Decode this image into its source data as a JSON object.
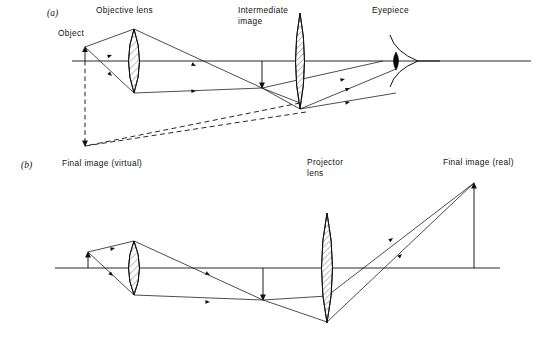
{
  "figure": {
    "background_color": "#ffffff",
    "ink_color": "#111111",
    "width": 545,
    "height": 338
  },
  "panels": [
    {
      "id": "a",
      "label": "(a)",
      "label_x": 47,
      "label_y": 16,
      "description": "Compound microscope forming a virtual final image",
      "axis": {
        "x1": 72,
        "x2": 531,
        "y": 61
      },
      "labels": [
        {
          "name": "object-label",
          "text": "Object",
          "x": 58,
          "y": 36,
          "anchor": "start"
        },
        {
          "name": "objective-lens-label",
          "text": "Objective lens",
          "x": 96,
          "y": 13,
          "anchor": "start"
        },
        {
          "name": "intermediate-image-label-line1",
          "text": "Intermediate",
          "x": 238,
          "y": 13,
          "anchor": "start"
        },
        {
          "name": "intermediate-image-label-line2",
          "text": "image",
          "x": 238,
          "y": 24,
          "anchor": "start"
        },
        {
          "name": "eyepiece-label",
          "text": "Eyepiece",
          "x": 372,
          "y": 13,
          "anchor": "start"
        },
        {
          "name": "final-image-virtual-label",
          "text": "Final image (virtual)",
          "x": 62,
          "y": 166,
          "anchor": "start"
        }
      ],
      "elements": {
        "object_arrow": {
          "x": 85,
          "y_base": 61,
          "y_tip": 47,
          "direction": "up",
          "style": "solid"
        },
        "intermediate_image_arrow": {
          "x": 262,
          "y_base": 61,
          "y_tip": 88,
          "direction": "down",
          "style": "solid"
        },
        "final_image_arrow": {
          "x": 85,
          "y_base": 61,
          "y_tip": 146,
          "direction": "down",
          "style": "dashed"
        },
        "objective_lens": {
          "cx": 134,
          "cy": 61,
          "half_width": 11,
          "half_height": 32
        },
        "eyepiece_lens": {
          "cx": 300,
          "cy": 61,
          "half_width": 9,
          "half_height": 48
        },
        "eye": {
          "cx": 396,
          "cy": 61
        }
      }
    },
    {
      "id": "b",
      "label": "(b)",
      "label_x": 21,
      "label_y": 165,
      "description": "Projector forming a real final image",
      "axis": {
        "x1": 55,
        "x2": 500,
        "y": 268
      },
      "labels": [
        {
          "name": "projector-lens-label-line1",
          "text": "Projector",
          "x": 307,
          "y": 165,
          "anchor": "start"
        },
        {
          "name": "projector-lens-label-line2",
          "text": "lens",
          "x": 307,
          "y": 176,
          "anchor": "start"
        },
        {
          "name": "final-image-real-label",
          "text": "Final image (real)",
          "x": 443,
          "y": 165,
          "anchor": "start"
        }
      ],
      "elements": {
        "object_arrow": {
          "x": 88,
          "y_base": 268,
          "y_tip": 252,
          "direction": "up",
          "style": "solid"
        },
        "intermediate_image_arrow": {
          "x": 263,
          "y_base": 268,
          "y_tip": 300,
          "direction": "down",
          "style": "solid"
        },
        "final_image_arrow": {
          "x": 474,
          "y_base": 268,
          "y_tip": 183,
          "direction": "up",
          "style": "solid"
        },
        "objective_lens": {
          "cx": 134,
          "cy": 268,
          "half_width": 11,
          "half_height": 27
        },
        "projector_lens": {
          "cx": 327,
          "cy": 268,
          "half_width": 10,
          "half_height": 55
        }
      }
    }
  ],
  "ray_style": {
    "solid_stroke": "#111111",
    "dashed_stroke": "#111111",
    "solid_width": 0.75,
    "dash_pattern": "5 3.4"
  }
}
